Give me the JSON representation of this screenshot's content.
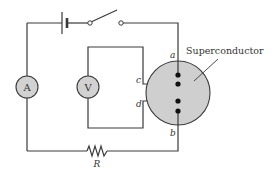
{
  "diagram": {
    "type": "circuit",
    "components": {
      "ammeter": {
        "label": "A"
      },
      "voltmeter": {
        "label": "V"
      },
      "resistor": {
        "label": "R"
      },
      "battery": {
        "label": ""
      },
      "switch": {
        "state": "open"
      },
      "superconductor": {
        "label": "Superconductor",
        "fill": "#cfcfcf"
      }
    },
    "nodes": {
      "a": "a",
      "b": "b",
      "c": "c",
      "d": "d"
    },
    "colors": {
      "wire": "#3a3a3a",
      "meter_fill": "#d2d2d2",
      "superconductor_fill": "#cfcfcf"
    }
  }
}
